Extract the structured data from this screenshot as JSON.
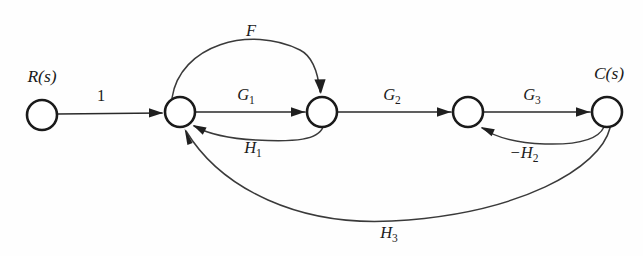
{
  "figure": {
    "type": "signal-flow-graph",
    "background_color": "#fefefe",
    "ink_color": "#1b1b1b",
    "width": 643,
    "height": 256
  },
  "nodes": [
    {
      "id": "n1",
      "label": "R(s)",
      "label_kind": "input",
      "x": 42,
      "y": 115,
      "r": 15
    },
    {
      "id": "n2",
      "label": "",
      "label_kind": "plain",
      "x": 180,
      "y": 112,
      "r": 15
    },
    {
      "id": "n3",
      "label": "",
      "label_kind": "plain",
      "x": 322,
      "y": 112,
      "r": 15
    },
    {
      "id": "n4",
      "label": "",
      "label_kind": "plain",
      "x": 468,
      "y": 112,
      "r": 15
    },
    {
      "id": "n5",
      "label": "C(s)",
      "label_kind": "output",
      "x": 607,
      "y": 112,
      "r": 15
    }
  ],
  "node_labels": {
    "input": "R(s)",
    "output": "C(s)"
  },
  "edges": [
    {
      "id": "e_in",
      "from": "n1",
      "to": "n2",
      "label": "1",
      "sub": "",
      "shape": "straight",
      "side": "above"
    },
    {
      "id": "e_g1",
      "from": "n2",
      "to": "n3",
      "label": "G",
      "sub": "1",
      "shape": "straight",
      "side": "above"
    },
    {
      "id": "e_g2",
      "from": "n3",
      "to": "n4",
      "label": "G",
      "sub": "2",
      "shape": "straight",
      "side": "above"
    },
    {
      "id": "e_g3",
      "from": "n4",
      "to": "n5",
      "label": "G",
      "sub": "3",
      "shape": "straight",
      "side": "above"
    },
    {
      "id": "e_f",
      "from": "n2",
      "to": "n3",
      "label": "F",
      "sub": "",
      "shape": "arc-above",
      "side": "above"
    },
    {
      "id": "e_h1",
      "from": "n3",
      "to": "n2",
      "label": "H",
      "sub": "1",
      "shape": "arc-below",
      "side": "below"
    },
    {
      "id": "e_h2",
      "from": "n5",
      "to": "n4",
      "label": "−H",
      "sub": "2",
      "shape": "arc-below",
      "side": "below"
    },
    {
      "id": "e_h3",
      "from": "n5",
      "to": "n2",
      "label": "H",
      "sub": "3",
      "shape": "arc-below-deep",
      "side": "below"
    }
  ],
  "edge_labels": {
    "unity": "1",
    "forward_1": "G",
    "forward_1_sub": "1",
    "forward_2": "G",
    "forward_2_sub": "2",
    "forward_3": "G",
    "forward_3_sub": "3",
    "feedforward": "F",
    "feedback_1": "H",
    "feedback_1_sub": "1",
    "feedback_2": "−H",
    "feedback_2_sub": "2",
    "feedback_3": "H",
    "feedback_3_sub": "3"
  },
  "label_positions": {
    "unity": {
      "x": 101,
      "y": 101
    },
    "forward_1": {
      "x": 249,
      "y": 100
    },
    "forward_2": {
      "x": 395,
      "y": 100
    },
    "forward_3": {
      "x": 535,
      "y": 100
    },
    "feedforward": {
      "x": 251,
      "y": 36
    },
    "feedback_1": {
      "x": 256,
      "y": 153
    },
    "feedback_2": {
      "x": 528,
      "y": 158
    },
    "feedback_3": {
      "x": 392,
      "y": 238
    },
    "input_node": {
      "x": 42,
      "y": 82
    },
    "output_node": {
      "x": 609,
      "y": 79
    }
  }
}
